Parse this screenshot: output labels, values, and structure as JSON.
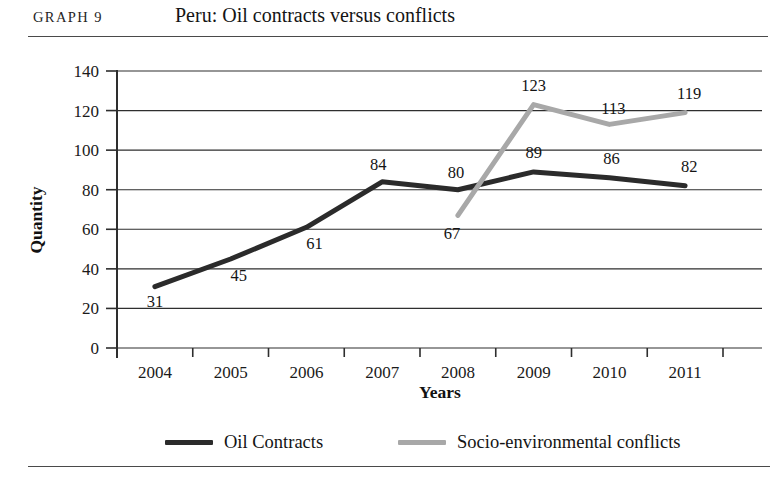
{
  "header": {
    "graph_number": "GRAPH 9",
    "title": "Peru: Oil contracts versus conflicts"
  },
  "chart_data": {
    "type": "line",
    "title": "Peru: Oil contracts versus conflicts",
    "xlabel": "Years",
    "ylabel": "Quantity",
    "categories": [
      "2004",
      "2005",
      "2006",
      "2007",
      "2008",
      "2009",
      "2010",
      "2011"
    ],
    "ylim": [
      0,
      140
    ],
    "yticks": [
      0,
      20,
      40,
      60,
      80,
      100,
      120,
      140
    ],
    "ytick_labels": [
      "0",
      "20",
      "40",
      "60",
      "80",
      "100",
      "120",
      "140"
    ],
    "grid": true,
    "legend_position": "bottom",
    "series": [
      {
        "name": "Oil Contracts",
        "color": "#2b2b2b",
        "stroke_width": 5,
        "values": [
          31,
          45,
          61,
          84,
          80,
          89,
          86,
          82
        ],
        "labels": [
          "31",
          "45",
          "61",
          "84",
          "80",
          "89",
          "86",
          "82"
        ],
        "label_offsets": [
          {
            "dx": 0,
            "dy": 20
          },
          {
            "dx": 8,
            "dy": 22
          },
          {
            "dx": 8,
            "dy": 22
          },
          {
            "dx": -4,
            "dy": -12
          },
          {
            "dx": -2,
            "dy": -12
          },
          {
            "dx": 0,
            "dy": -14
          },
          {
            "dx": 2,
            "dy": -14
          },
          {
            "dx": 4,
            "dy": -14
          }
        ]
      },
      {
        "name": "Socio-environmental conflicts",
        "color": "#a8a8a8",
        "stroke_width": 5,
        "values": [
          null,
          null,
          null,
          null,
          67,
          123,
          113,
          119
        ],
        "labels": [
          "",
          "",
          "",
          "",
          "67",
          "123",
          "113",
          "119"
        ],
        "label_offsets": [
          {
            "dx": 0,
            "dy": 0
          },
          {
            "dx": 0,
            "dy": 0
          },
          {
            "dx": 0,
            "dy": 0
          },
          {
            "dx": 0,
            "dy": 0
          },
          {
            "dx": -6,
            "dy": 24
          },
          {
            "dx": 0,
            "dy": -14
          },
          {
            "dx": 4,
            "dy": -10
          },
          {
            "dx": 4,
            "dy": -14
          }
        ]
      }
    ]
  },
  "legend": {
    "items": [
      {
        "label": "Oil Contracts",
        "color": "#2b2b2b"
      },
      {
        "label": "Socio-environmental conflicts",
        "color": "#a8a8a8"
      }
    ]
  }
}
